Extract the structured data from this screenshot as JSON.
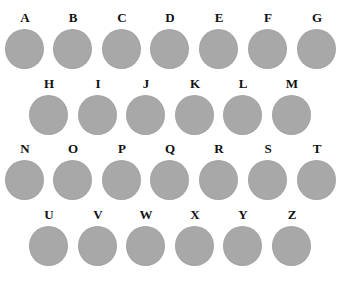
{
  "figure": {
    "dot_color": "#a8a8a8",
    "rows": [
      {
        "y": 11,
        "items": [
          {
            "label": "A",
            "x": 5
          },
          {
            "label": "B",
            "x": 53
          },
          {
            "label": "C",
            "x": 102
          },
          {
            "label": "D",
            "x": 150
          },
          {
            "label": "E",
            "x": 199
          },
          {
            "label": "F",
            "x": 248
          },
          {
            "label": "G",
            "x": 297
          }
        ]
      },
      {
        "y": 77,
        "items": [
          {
            "label": "H",
            "x": 29
          },
          {
            "label": "I",
            "x": 78
          },
          {
            "label": "J",
            "x": 126
          },
          {
            "label": "K",
            "x": 175
          },
          {
            "label": "L",
            "x": 223
          },
          {
            "label": "M",
            "x": 272
          }
        ]
      },
      {
        "y": 142,
        "items": [
          {
            "label": "N",
            "x": 5
          },
          {
            "label": "O",
            "x": 53
          },
          {
            "label": "P",
            "x": 102
          },
          {
            "label": "Q",
            "x": 150
          },
          {
            "label": "R",
            "x": 199
          },
          {
            "label": "S",
            "x": 248
          },
          {
            "label": "T",
            "x": 297
          }
        ]
      },
      {
        "y": 208,
        "items": [
          {
            "label": "U",
            "x": 29
          },
          {
            "label": "V",
            "x": 78
          },
          {
            "label": "W",
            "x": 126
          },
          {
            "label": "X",
            "x": 175
          },
          {
            "label": "Y",
            "x": 223
          },
          {
            "label": "Z",
            "x": 272
          }
        ]
      }
    ]
  }
}
